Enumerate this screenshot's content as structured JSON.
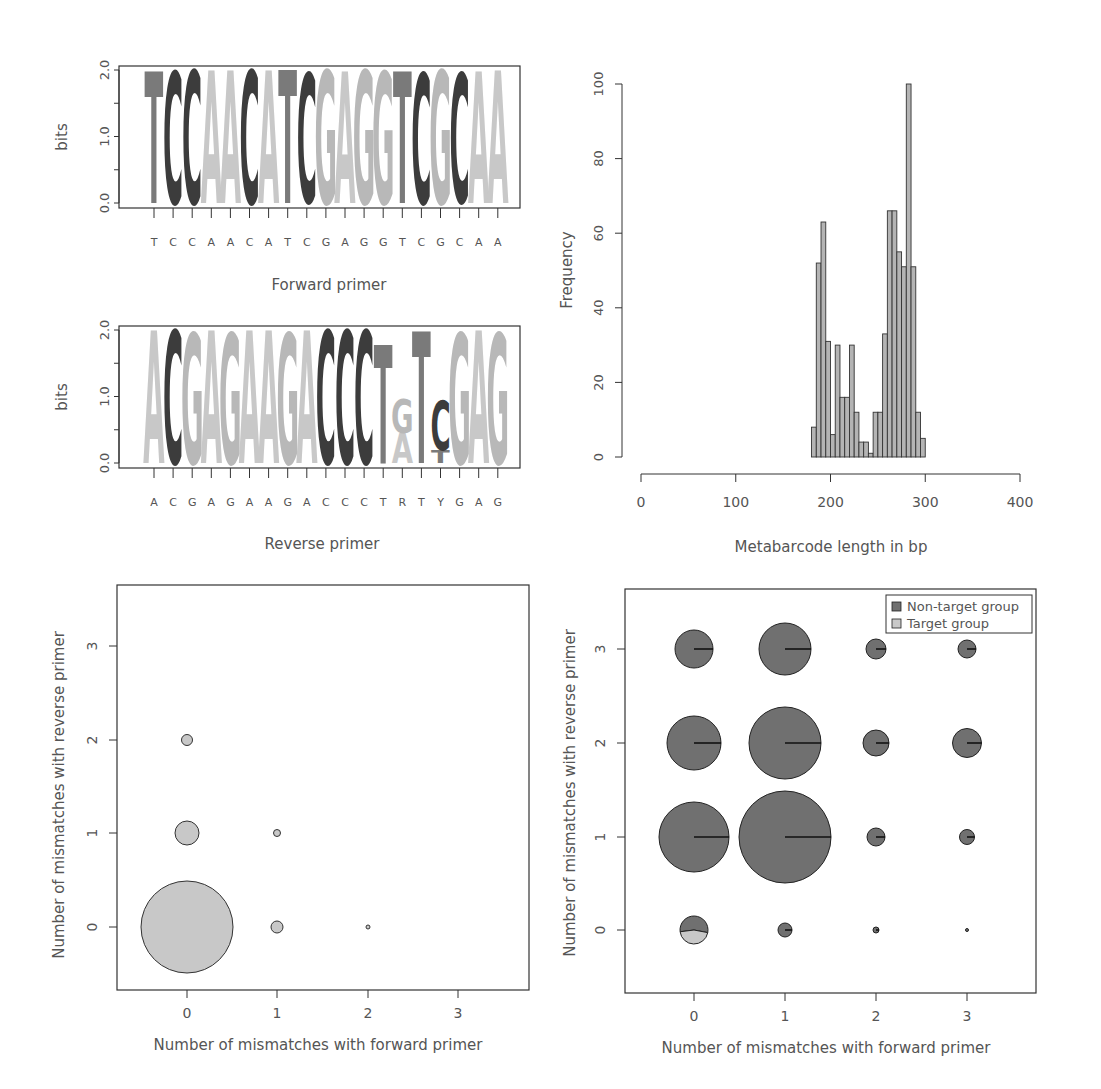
{
  "chart_data": [
    {
      "id": "forward-logo",
      "type": "sequence-logo",
      "title": "",
      "xlabel": "Forward primer",
      "ylabel": "bits",
      "ylim": [
        0,
        2
      ],
      "yticks": [
        "0.0",
        "1.0",
        "2.0"
      ],
      "sequence": [
        "T",
        "C",
        "C",
        "A",
        "A",
        "C",
        "A",
        "T",
        "C",
        "G",
        "A",
        "G",
        "G",
        "T",
        "C",
        "G",
        "C",
        "A",
        "A"
      ],
      "positions": [
        {
          "letters": [
            {
              "base": "T",
              "bits": 1.98
            }
          ]
        },
        {
          "letters": [
            {
              "base": "C",
              "bits": 1.98
            }
          ]
        },
        {
          "letters": [
            {
              "base": "C",
              "bits": 2.0
            }
          ]
        },
        {
          "letters": [
            {
              "base": "A",
              "bits": 2.0
            }
          ]
        },
        {
          "letters": [
            {
              "base": "A",
              "bits": 2.0
            }
          ]
        },
        {
          "letters": [
            {
              "base": "C",
              "bits": 2.0
            }
          ]
        },
        {
          "letters": [
            {
              "base": "A",
              "bits": 2.0
            }
          ]
        },
        {
          "letters": [
            {
              "base": "T",
              "bits": 2.0
            }
          ]
        },
        {
          "letters": [
            {
              "base": "C",
              "bits": 1.93
            }
          ]
        },
        {
          "letters": [
            {
              "base": "G",
              "bits": 2.0
            }
          ]
        },
        {
          "letters": [
            {
              "base": "A",
              "bits": 1.98
            }
          ]
        },
        {
          "letters": [
            {
              "base": "G",
              "bits": 2.0
            }
          ]
        },
        {
          "letters": [
            {
              "base": "G",
              "bits": 1.98
            }
          ]
        },
        {
          "letters": [
            {
              "base": "T",
              "bits": 1.98
            }
          ]
        },
        {
          "letters": [
            {
              "base": "C",
              "bits": 1.96
            }
          ]
        },
        {
          "letters": [
            {
              "base": "G",
              "bits": 2.0
            }
          ]
        },
        {
          "letters": [
            {
              "base": "C",
              "bits": 1.94
            }
          ]
        },
        {
          "letters": [
            {
              "base": "A",
              "bits": 1.98
            }
          ]
        },
        {
          "letters": [
            {
              "base": "A",
              "bits": 2.0
            }
          ]
        }
      ]
    },
    {
      "id": "reverse-logo",
      "type": "sequence-logo",
      "title": "",
      "xlabel": "Reverse primer",
      "ylabel": "bits",
      "ylim": [
        0,
        2
      ],
      "yticks": [
        "0.0",
        "1.0",
        "2.0"
      ],
      "sequence": [
        "A",
        "C",
        "G",
        "A",
        "G",
        "A",
        "A",
        "G",
        "A",
        "C",
        "C",
        "C",
        "T",
        "R",
        "T",
        "Y",
        "G",
        "A",
        "G"
      ],
      "positions": [
        {
          "letters": [
            {
              "base": "A",
              "bits": 2.0
            }
          ]
        },
        {
          "letters": [
            {
              "base": "C",
              "bits": 2.0
            }
          ]
        },
        {
          "letters": [
            {
              "base": "G",
              "bits": 1.95
            }
          ]
        },
        {
          "letters": [
            {
              "base": "A",
              "bits": 2.0
            }
          ]
        },
        {
          "letters": [
            {
              "base": "G",
              "bits": 1.95
            }
          ]
        },
        {
          "letters": [
            {
              "base": "A",
              "bits": 2.0
            }
          ]
        },
        {
          "letters": [
            {
              "base": "A",
              "bits": 2.0
            }
          ]
        },
        {
          "letters": [
            {
              "base": "G",
              "bits": 1.95
            }
          ]
        },
        {
          "letters": [
            {
              "base": "A",
              "bits": 2.0
            }
          ]
        },
        {
          "letters": [
            {
              "base": "C",
              "bits": 2.0
            }
          ]
        },
        {
          "letters": [
            {
              "base": "C",
              "bits": 2.0
            }
          ]
        },
        {
          "letters": [
            {
              "base": "C",
              "bits": 2.0
            }
          ]
        },
        {
          "letters": [
            {
              "base": "T",
              "bits": 1.78
            }
          ]
        },
        {
          "letters": [
            {
              "base": "A",
              "bits": 0.45
            },
            {
              "base": "G",
              "bits": 0.5
            }
          ]
        },
        {
          "letters": [
            {
              "base": "T",
              "bits": 1.98
            }
          ]
        },
        {
          "letters": [
            {
              "base": "T",
              "bits": 0.2
            },
            {
              "base": "C",
              "bits": 0.75
            }
          ]
        },
        {
          "letters": [
            {
              "base": "G",
              "bits": 1.95
            }
          ]
        },
        {
          "letters": [
            {
              "base": "A",
              "bits": 2.0
            }
          ]
        },
        {
          "letters": [
            {
              "base": "G",
              "bits": 1.95
            }
          ]
        }
      ]
    },
    {
      "id": "length-histogram",
      "type": "bar",
      "title": "",
      "xlabel": "Metabarcode length in bp",
      "ylabel": "Frequency",
      "xlim": [
        0,
        400
      ],
      "ylim": [
        0,
        100
      ],
      "xticks": [
        "0",
        "100",
        "200",
        "300",
        "400"
      ],
      "yticks": [
        "0",
        "20",
        "40",
        "60",
        "80",
        "100"
      ],
      "bin_width": 5,
      "bin_start": 180,
      "categories": [
        "180",
        "185",
        "190",
        "195",
        "200",
        "205",
        "210",
        "215",
        "220",
        "225",
        "230",
        "235",
        "240",
        "245",
        "250",
        "255",
        "260",
        "265",
        "270",
        "275",
        "280",
        "285",
        "290",
        "295"
      ],
      "values": [
        8,
        52,
        63,
        31,
        6,
        30,
        16,
        16,
        30,
        12,
        4,
        4,
        1,
        12,
        12,
        33,
        66,
        66,
        55,
        51,
        100,
        51,
        12,
        5
      ],
      "grid": false
    },
    {
      "id": "mismatch-target",
      "type": "scatter",
      "title": "",
      "xlabel": "Number of mismatches with forward primer",
      "ylabel": "Number of mismatches with reverse primer",
      "xticks": [
        "0",
        "1",
        "2",
        "3"
      ],
      "yticks": [
        "0",
        "1",
        "2",
        "3"
      ],
      "points": [
        {
          "x": 0,
          "y": 0,
          "size": 46
        },
        {
          "x": 0,
          "y": 1,
          "size": 12
        },
        {
          "x": 0,
          "y": 2,
          "size": 5.5
        },
        {
          "x": 1,
          "y": 0,
          "size": 6
        },
        {
          "x": 1,
          "y": 1,
          "size": 3.5
        },
        {
          "x": 2,
          "y": 0,
          "size": 2
        }
      ]
    },
    {
      "id": "mismatch-pies",
      "type": "pie-scatter",
      "title": "",
      "xlabel": "Number of mismatches with forward primer",
      "ylabel": "Number of mismatches with reverse primer",
      "xticks": [
        "0",
        "1",
        "2",
        "3"
      ],
      "yticks": [
        "0",
        "1",
        "2",
        "3"
      ],
      "legend": {
        "position": "top-right",
        "entries": [
          {
            "label": "Non-target group",
            "color": "#707070"
          },
          {
            "label": "Target group",
            "color": "#c8c8c8"
          }
        ]
      },
      "points": [
        {
          "x": 0,
          "y": 3,
          "size": 19,
          "target_fraction": 0
        },
        {
          "x": 1,
          "y": 3,
          "size": 26,
          "target_fraction": 0
        },
        {
          "x": 2,
          "y": 3,
          "size": 10,
          "target_fraction": 0
        },
        {
          "x": 3,
          "y": 3,
          "size": 9,
          "target_fraction": 0
        },
        {
          "x": 0,
          "y": 2,
          "size": 27,
          "target_fraction": 0
        },
        {
          "x": 1,
          "y": 2,
          "size": 36,
          "target_fraction": 0
        },
        {
          "x": 2,
          "y": 2,
          "size": 13,
          "target_fraction": 0
        },
        {
          "x": 3,
          "y": 2,
          "size": 14.5,
          "target_fraction": 0
        },
        {
          "x": 0,
          "y": 1,
          "size": 35,
          "target_fraction": 0
        },
        {
          "x": 1,
          "y": 1,
          "size": 46,
          "target_fraction": 0
        },
        {
          "x": 2,
          "y": 1,
          "size": 9,
          "target_fraction": 0
        },
        {
          "x": 3,
          "y": 1,
          "size": 7.5,
          "target_fraction": 0
        },
        {
          "x": 0,
          "y": 0,
          "size": 14,
          "target_fraction": 0.45
        },
        {
          "x": 1,
          "y": 0,
          "size": 7,
          "target_fraction": 0
        },
        {
          "x": 2,
          "y": 0,
          "size": 3,
          "target_fraction": 0
        },
        {
          "x": 3,
          "y": 0,
          "size": 1.5,
          "target_fraction": 0
        }
      ]
    }
  ],
  "colors": {
    "T": "#7a7a7a",
    "C": "#3c3c3c",
    "A": "#c8c8c8",
    "G": "#b8b8b8",
    "bar_fill": "#b4b4b4",
    "non_target": "#707070",
    "target": "#c8c8c8",
    "axis": "#333333"
  },
  "labels": {
    "bits": "bits",
    "forward_primer": "Forward primer",
    "reverse_primer": "Reverse primer",
    "frequency": "Frequency",
    "length": "Metabarcode length in bp",
    "x_mismatch": "Number of mismatches with forward primer",
    "y_mismatch": "Number of mismatches with reverse primer",
    "legend_nontarget": "Non-target group",
    "legend_target": "Target group"
  }
}
